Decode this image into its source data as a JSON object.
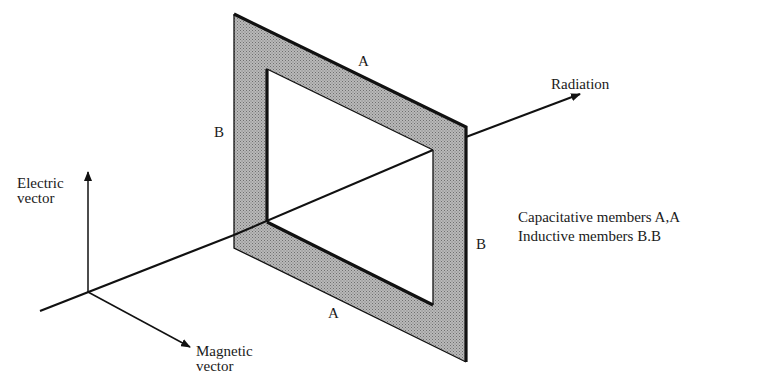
{
  "diagram": {
    "title": "",
    "frame": {
      "fill_color": "#a8a8a8",
      "edge_color": "#111111",
      "outer": [
        [
          234,
          14
        ],
        [
          466,
          127
        ],
        [
          466,
          362
        ],
        [
          234,
          248
        ]
      ],
      "inner": [
        [
          267,
          69
        ],
        [
          433,
          150
        ],
        [
          433,
          305
        ],
        [
          267,
          222
        ]
      ]
    },
    "labels": {
      "top_member": "A",
      "bottom_member": "A",
      "left_member": "B",
      "right_member": "B",
      "radiation": "Radiation",
      "electric_line1": "Electric",
      "electric_line2": "vector",
      "magnetic_line1": "Magnetic",
      "magnetic_line2": "vector",
      "legend_line1": "Capacitative members A,A",
      "legend_line2": "Inductive members B.B"
    },
    "axes": {
      "origin": [
        88,
        292
      ],
      "radiation_start": [
        40,
        311
      ],
      "radiation_end": [
        580,
        94
      ],
      "electric_end": [
        88,
        172
      ],
      "magnetic_end": [
        190,
        347
      ]
    }
  }
}
